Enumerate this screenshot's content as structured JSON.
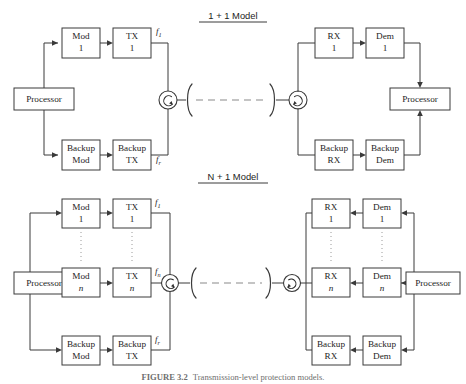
{
  "figure": {
    "caption_bold": "FIGURE 3.2",
    "caption_rest": "Transmission-level protection models."
  },
  "models": [
    {
      "id": "model-1plus1",
      "title": "1 + 1 Model",
      "tx_side": {
        "processor_label": "Processor",
        "rows": [
          {
            "id": "primary",
            "mod": "Mod",
            "mod_idx": "1",
            "tx": "TX",
            "tx_idx": "1",
            "freq": "f",
            "freq_sub": "1"
          },
          {
            "id": "backup",
            "mod": "Backup",
            "mod_idx": "Mod",
            "tx": "Backup",
            "tx_idx": "TX",
            "freq": "f",
            "freq_sub": "r"
          }
        ]
      },
      "rx_side": {
        "processor_label": "Processor",
        "rows": [
          {
            "id": "primary",
            "rx": "RX",
            "rx_idx": "1",
            "dem": "Dem",
            "dem_idx": "1"
          },
          {
            "id": "backup",
            "rx": "Backup",
            "rx_idx": "RX",
            "dem": "Backup",
            "dem_idx": "Dem"
          }
        ]
      },
      "link": {
        "circulator_left": "circulator-icon",
        "circulator_right": "circulator-icon",
        "fiber": "fiber-span-dashed"
      }
    },
    {
      "id": "model-nplus1",
      "title": "N + 1 Model",
      "tx_side": {
        "processor_label": "Processor",
        "rows": [
          {
            "id": "first",
            "mod": "Mod",
            "mod_idx": "1",
            "tx": "TX",
            "tx_idx": "1",
            "freq": "f",
            "freq_sub": "1"
          },
          {
            "id": "nth",
            "mod": "Mod",
            "mod_idx": "n",
            "tx": "TX",
            "tx_idx": "n",
            "freq": "f",
            "freq_sub": "n"
          },
          {
            "id": "backup",
            "mod": "Backup",
            "mod_idx": "Mod",
            "tx": "Backup",
            "tx_idx": "TX",
            "freq": "f",
            "freq_sub": "r"
          }
        ]
      },
      "rx_side": {
        "processor_label": "Processor",
        "rows": [
          {
            "id": "first",
            "rx": "RX",
            "rx_idx": "1",
            "dem": "Dem",
            "dem_idx": "1"
          },
          {
            "id": "nth",
            "rx": "RX",
            "rx_idx": "n",
            "dem": "Dem",
            "dem_idx": "n"
          },
          {
            "id": "backup",
            "rx": "Backup",
            "rx_idx": "RX",
            "dem": "Backup",
            "dem_idx": "Dem"
          }
        ]
      },
      "link": {
        "circulator_left": "circulator-icon",
        "circulator_right": "circulator-icon",
        "fiber": "fiber-span-dashed"
      }
    }
  ],
  "colors": {
    "stroke": "#3a3a3a",
    "fiber": "#8a8a8a",
    "text": "#1d1d1d",
    "caption": "#6e6e6e"
  }
}
